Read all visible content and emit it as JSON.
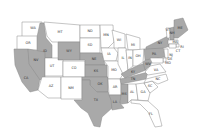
{
  "map": {
    "type": "choropleth",
    "region": "United States",
    "colors": {
      "highlighted": "#a9a9a9",
      "default": "#ffffff",
      "border": "#8a8a8a"
    },
    "states": [
      {
        "abbr": "WA",
        "highlighted": false
      },
      {
        "abbr": "OR",
        "highlighted": false
      },
      {
        "abbr": "CA",
        "highlighted": true
      },
      {
        "abbr": "ID",
        "highlighted": true
      },
      {
        "abbr": "NV",
        "highlighted": true
      },
      {
        "abbr": "MT",
        "highlighted": false
      },
      {
        "abbr": "WY",
        "highlighted": true
      },
      {
        "abbr": "UT",
        "highlighted": false
      },
      {
        "abbr": "AZ",
        "highlighted": false
      },
      {
        "abbr": "CO",
        "highlighted": false
      },
      {
        "abbr": "NM",
        "highlighted": false
      },
      {
        "abbr": "ND",
        "highlighted": false
      },
      {
        "abbr": "SD",
        "highlighted": false
      },
      {
        "abbr": "NE",
        "highlighted": true
      },
      {
        "abbr": "KS",
        "highlighted": true
      },
      {
        "abbr": "OK",
        "highlighted": true
      },
      {
        "abbr": "TX",
        "highlighted": true
      },
      {
        "abbr": "MN",
        "highlighted": false
      },
      {
        "abbr": "IA",
        "highlighted": false
      },
      {
        "abbr": "MO",
        "highlighted": false
      },
      {
        "abbr": "AR",
        "highlighted": false
      },
      {
        "abbr": "LA",
        "highlighted": true
      },
      {
        "abbr": "WI",
        "highlighted": false
      },
      {
        "abbr": "IL",
        "highlighted": false
      },
      {
        "abbr": "MI",
        "highlighted": false
      },
      {
        "abbr": "IN",
        "highlighted": false
      },
      {
        "abbr": "OH",
        "highlighted": false
      },
      {
        "abbr": "KY",
        "highlighted": true
      },
      {
        "abbr": "TN",
        "highlighted": true
      },
      {
        "abbr": "MS",
        "highlighted": true
      },
      {
        "abbr": "AL",
        "highlighted": false
      },
      {
        "abbr": "GA",
        "highlighted": false
      },
      {
        "abbr": "FL",
        "highlighted": false
      },
      {
        "abbr": "SC",
        "highlighted": false
      },
      {
        "abbr": "NC",
        "highlighted": false
      },
      {
        "abbr": "VA",
        "highlighted": false
      },
      {
        "abbr": "WV",
        "highlighted": true
      },
      {
        "abbr": "PA",
        "highlighted": true
      },
      {
        "abbr": "NY",
        "highlighted": true
      },
      {
        "abbr": "VT",
        "highlighted": false
      },
      {
        "abbr": "NH",
        "highlighted": true
      },
      {
        "abbr": "ME",
        "highlighted": true
      },
      {
        "abbr": "MA",
        "highlighted": false
      },
      {
        "abbr": "RI",
        "highlighted": false
      },
      {
        "abbr": "CT",
        "highlighted": false
      },
      {
        "abbr": "NJ",
        "highlighted": false
      },
      {
        "abbr": "DE",
        "highlighted": false
      },
      {
        "abbr": "MD",
        "highlighted": false
      }
    ]
  }
}
